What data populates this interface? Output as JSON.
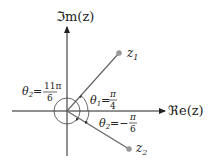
{
  "diagram": {
    "axes": {
      "imaginary_label": "ℑm(z)",
      "real_label": "ℜe(z)"
    },
    "points": [
      {
        "name": "z",
        "subscript": "1",
        "angle_label": "θ",
        "angle_sub": "1",
        "angle_eq": "=",
        "angle_num": "π",
        "angle_den": "4"
      },
      {
        "name": "z",
        "subscript": "2",
        "angle_label": "θ",
        "angle_sub": "2",
        "angle_eq": "=−",
        "angle_num": "π",
        "angle_den": "6"
      }
    ],
    "alt_angle": {
      "label": "θ",
      "sub": "2",
      "eq": "=",
      "num": "11π",
      "den": "6"
    },
    "colors": {
      "axis": "#222222",
      "ray": "#666666",
      "point": "#999999"
    }
  }
}
